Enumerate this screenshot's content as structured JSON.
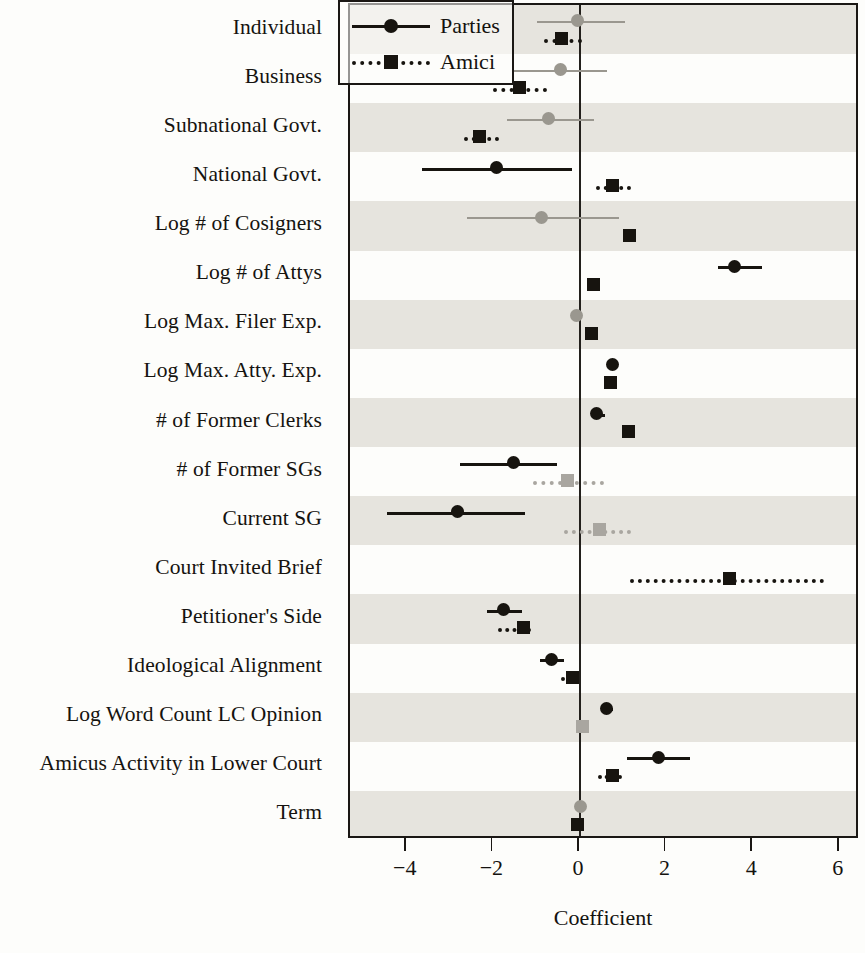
{
  "chart_data": {
    "type": "scatter",
    "title": "",
    "xlabel": "Coefficient",
    "ylabel": "",
    "xlim": [
      -5.2,
      6.45
    ],
    "xticks": [
      -4,
      -2,
      0,
      2,
      4,
      6
    ],
    "xtick_labels": [
      "−4",
      "−2",
      "0",
      "2",
      "4",
      "6"
    ],
    "grid": false,
    "zero_reference_line": 0,
    "legend_position": "top-right",
    "legend": [
      {
        "name": "Parties",
        "marker": "circle",
        "line": "solid"
      },
      {
        "name": "Amici",
        "marker": "square",
        "line": "dotted"
      }
    ],
    "categories": [
      "Individual",
      "Business",
      "Subnational Govt.",
      "National Govt.",
      "Log # of Cosigners",
      "Log # of Attys",
      "Log Max. Filer Exp.",
      "Log Max. Atty. Exp.",
      "# of Former Clerks",
      "# of Former SGs",
      "Current SG",
      "Court Invited Brief",
      "Petitioner's Side",
      "Ideological Alignment",
      "Log Word Count LC Opinion",
      "Amicus Activity in Lower Court",
      "Term"
    ],
    "series": [
      {
        "name": "Parties",
        "marker": "circle",
        "line": "solid",
        "points": [
          {
            "category": "Individual",
            "estimate": -0.05,
            "low": -1.0,
            "high": 1.05,
            "significant": false
          },
          {
            "category": "Business",
            "estimate": -0.46,
            "low": -1.53,
            "high": 0.62,
            "significant": false
          },
          {
            "category": "Subnational Govt.",
            "estimate": -0.72,
            "low": -1.69,
            "high": 0.32,
            "significant": false
          },
          {
            "category": "National Govt.",
            "estimate": -1.92,
            "low": -3.65,
            "high": -0.19,
            "significant": true
          },
          {
            "category": "Log # of Cosigners",
            "estimate": -0.88,
            "low": -2.61,
            "high": 0.9,
            "significant": false
          },
          {
            "category": "Log # of Attys",
            "estimate": 3.56,
            "low": 3.18,
            "high": 4.2,
            "significant": true
          },
          {
            "category": "Log Max. Filer Exp.",
            "estimate": -0.07,
            "low": -0.17,
            "high": 0.05,
            "significant": false
          },
          {
            "category": "Log Max. Atty. Exp.",
            "estimate": 0.74,
            "low": 0.62,
            "high": 0.87,
            "significant": true
          },
          {
            "category": "# of Former Clerks",
            "estimate": 0.39,
            "low": 0.27,
            "high": 0.57,
            "significant": true
          },
          {
            "category": "# of Former SGs",
            "estimate": -1.53,
            "low": -2.77,
            "high": -0.53,
            "significant": true
          },
          {
            "category": "Current SG",
            "estimate": -2.84,
            "low": -4.45,
            "high": -1.28,
            "significant": true
          },
          {
            "category": "Court Invited Brief",
            "estimate": null,
            "low": null,
            "high": null,
            "significant": false
          },
          {
            "category": "Petitioner's Side",
            "estimate": -1.76,
            "low": -2.15,
            "high": -1.34,
            "significant": true
          },
          {
            "category": "Ideological Alignment",
            "estimate": -0.65,
            "low": -0.92,
            "high": -0.37,
            "significant": true
          },
          {
            "category": "Log Word Count LC Opinion",
            "estimate": 0.62,
            "low": 0.5,
            "high": 0.76,
            "significant": true
          },
          {
            "category": "Amicus Activity in Lower Court",
            "estimate": 1.82,
            "low": 1.08,
            "high": 2.54,
            "significant": true
          },
          {
            "category": "Term",
            "estimate": 0.0,
            "low": -0.04,
            "high": 0.04,
            "significant": false
          }
        ]
      },
      {
        "name": "Amici",
        "marker": "square",
        "line": "dotted",
        "points": [
          {
            "category": "Individual",
            "estimate": -0.42,
            "low": -0.82,
            "high": 0.05,
            "significant": true
          },
          {
            "category": "Business",
            "estimate": -1.4,
            "low": -2.02,
            "high": -0.77,
            "significant": true
          },
          {
            "category": "Subnational Govt.",
            "estimate": -2.31,
            "low": -2.69,
            "high": -1.87,
            "significant": true
          },
          {
            "category": "National Govt.",
            "estimate": 0.76,
            "low": 0.37,
            "high": 1.17,
            "significant": true
          },
          {
            "category": "Log # of Cosigners",
            "estimate": 1.15,
            "low": 1.02,
            "high": 1.29,
            "significant": true
          },
          {
            "category": "Log # of Attys",
            "estimate": 0.32,
            "low": 0.19,
            "high": 0.44,
            "significant": true
          },
          {
            "category": "Log Max. Filer Exp.",
            "estimate": 0.27,
            "low": 0.18,
            "high": 0.36,
            "significant": true
          },
          {
            "category": "Log Max. Atty. Exp.",
            "estimate": 0.7,
            "low": 0.6,
            "high": 0.82,
            "significant": true
          },
          {
            "category": "# of Former Clerks",
            "estimate": 1.13,
            "low": 1.0,
            "high": 1.26,
            "significant": true
          },
          {
            "category": "# of Former SGs",
            "estimate": -0.28,
            "low": -1.08,
            "high": 0.55,
            "significant": false
          },
          {
            "category": "Current SG",
            "estimate": 0.44,
            "low": -0.37,
            "high": 1.18,
            "significant": false
          },
          {
            "category": "Court Invited Brief",
            "estimate": 3.46,
            "low": 1.15,
            "high": 5.63,
            "significant": true
          },
          {
            "category": "Petitioner's Side",
            "estimate": -1.3,
            "low": -1.9,
            "high": -1.12,
            "significant": true
          },
          {
            "category": "Ideological Alignment",
            "estimate": -0.18,
            "low": -0.45,
            "high": -0.07,
            "significant": true
          },
          {
            "category": "Log Word Count LC Opinion",
            "estimate": 0.05,
            "low": -0.02,
            "high": 0.12,
            "significant": false
          },
          {
            "category": "Amicus Activity in Lower Court",
            "estimate": 0.74,
            "low": 0.42,
            "high": 0.97,
            "significant": true
          },
          {
            "category": "Term",
            "estimate": -0.05,
            "low": -0.09,
            "high": -0.01,
            "significant": true
          }
        ]
      }
    ]
  }
}
